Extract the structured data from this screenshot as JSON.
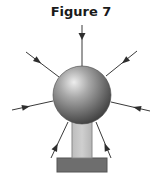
{
  "figure": {
    "title": "Figure 7"
  },
  "colors": {
    "line": "#3a3a3a",
    "sphere_highlight": "#e8e8e8",
    "sphere_mid": "#9a9a9a",
    "sphere_shadow": "#4a4a4a",
    "stem": "#c4c4c4",
    "stem_border": "#8a8a8a",
    "base": "#6e6e6e",
    "base_border": "#555555"
  },
  "arrows": [
    {
      "id": "top",
      "x1": 82,
      "y1": 25,
      "x2": 82,
      "y2": 66
    },
    {
      "id": "upper-left",
      "x1": 26,
      "y1": 52,
      "x2": 59,
      "y2": 77
    },
    {
      "id": "upper-right",
      "x1": 137,
      "y1": 51,
      "x2": 106,
      "y2": 76
    },
    {
      "id": "left",
      "x1": 12,
      "y1": 110,
      "x2": 53,
      "y2": 101
    },
    {
      "id": "right",
      "x1": 150,
      "y1": 111,
      "x2": 111,
      "y2": 102
    },
    {
      "id": "lower-left",
      "x1": 51,
      "y1": 158,
      "x2": 68,
      "y2": 122
    },
    {
      "id": "lower-right",
      "x1": 111,
      "y1": 158,
      "x2": 96,
      "y2": 122
    }
  ],
  "sphere": {
    "cx": 82,
    "cy": 95,
    "r": 29
  },
  "stem": {
    "x": 72,
    "y": 121,
    "width": 20,
    "height": 37
  },
  "base": {
    "x": 57,
    "y": 158,
    "width": 50,
    "height": 14
  }
}
